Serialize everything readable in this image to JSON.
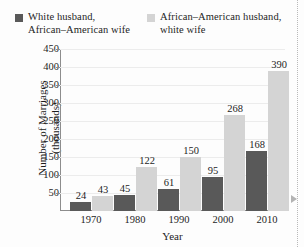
{
  "chart_data": {
    "type": "bar",
    "title": "",
    "xlabel": "Year",
    "ylabel": "Number of Marriages\n(thousands)",
    "categories": [
      "1970",
      "1980",
      "1990",
      "2000",
      "2010"
    ],
    "series": [
      {
        "name": "White husband,\nAfrican–American wife",
        "color": "#595959",
        "values": [
          24,
          45,
          61,
          95,
          168
        ]
      },
      {
        "name": "African–American husband,\nwhite wife",
        "color": "#d4d4d4",
        "values": [
          43,
          122,
          150,
          268,
          390
        ]
      }
    ],
    "ylim": [
      0,
      450
    ],
    "ytick_labels": [
      "450",
      "400",
      "350",
      "300",
      "250",
      "200",
      "150",
      "100",
      "50"
    ],
    "ytick_values": [
      450,
      400,
      350,
      300,
      250,
      200,
      150,
      100,
      50
    ],
    "grid": true,
    "legend_position": "top",
    "value_labels": true
  },
  "legend": {
    "items": [
      {
        "swatch": "dark-square-icon",
        "label": "White husband,\nAfrican–American wife"
      },
      {
        "swatch": "light-square-icon",
        "label": "African–American husband,\nwhite wife"
      }
    ]
  },
  "axes": {
    "y_title": "Number of Marriages\n(thousands)",
    "x_title": "Year"
  },
  "colors": {
    "series_dark": "#595959",
    "series_light": "#d4d4d4",
    "axis": "#8d8d8d",
    "grid": "#ececec",
    "text": "#1d1d1d"
  }
}
